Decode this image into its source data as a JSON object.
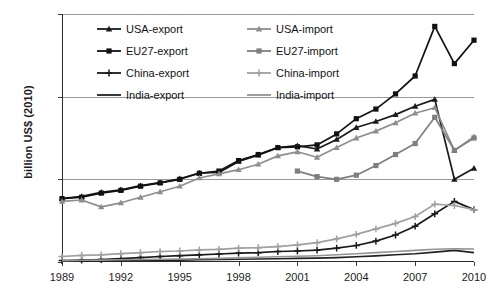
{
  "chart_data": {
    "type": "line",
    "title": "",
    "xlabel": "",
    "ylabel": "billion US$ (2010)",
    "xlim": [
      1989,
      2010
    ],
    "ylim": [
      0,
      90
    ],
    "yticks": [
      0,
      30,
      60,
      90
    ],
    "xticks": [
      1989,
      1992,
      1995,
      1998,
      2001,
      2004,
      2007,
      2010
    ],
    "grid": true,
    "legend_position": "top-inside",
    "x": [
      1989,
      1990,
      1991,
      1992,
      1993,
      1994,
      1995,
      1996,
      1997,
      1998,
      1999,
      2000,
      2001,
      2002,
      2003,
      2004,
      2005,
      2006,
      2007,
      2008,
      2009,
      2010
    ],
    "series": [
      {
        "name": "USA-export",
        "color": "#1a1a1a",
        "marker": "triangle",
        "values": [
          23.0,
          23.8,
          25.3,
          26.2,
          27.7,
          28.8,
          30.2,
          32.3,
          32.5,
          36.5,
          38.8,
          41.5,
          42.2,
          41.0,
          44.5,
          48.8,
          51.0,
          53.5,
          56.5,
          59.0,
          30.0,
          34.0
        ]
      },
      {
        "name": "EU27-export",
        "color": "#111111",
        "marker": "square",
        "values": [
          23.0,
          23.5,
          25.0,
          26.0,
          27.5,
          28.7,
          30.0,
          32.2,
          33.0,
          36.8,
          39.0,
          41.5,
          41.8,
          42.5,
          46.5,
          52.0,
          55.5,
          61.0,
          67.5,
          85.5,
          72.0,
          80.5
        ]
      },
      {
        "name": "China-export",
        "color": "#1a1a1a",
        "marker": "cross",
        "values": [
          0.5,
          0.7,
          0.9,
          1.2,
          1.6,
          2.0,
          2.3,
          2.6,
          2.9,
          3.2,
          3.4,
          3.8,
          4.0,
          4.3,
          5.0,
          6.0,
          7.6,
          9.8,
          13.0,
          17.5,
          22.0,
          19.0
        ]
      },
      {
        "name": "India-export",
        "color": "#222222",
        "marker": "none",
        "values": [
          0.3,
          0.35,
          0.4,
          0.45,
          0.5,
          0.6,
          0.7,
          0.8,
          0.9,
          1.0,
          1.1,
          1.2,
          1.3,
          1.4,
          1.6,
          1.9,
          2.2,
          2.6,
          3.0,
          3.6,
          4.2,
          3.4
        ]
      },
      {
        "name": "USA-import",
        "color": "#8e8e8e",
        "marker": "triangle",
        "values": [
          22.0,
          22.5,
          20.0,
          21.5,
          23.5,
          25.5,
          27.5,
          30.5,
          32.0,
          33.5,
          35.5,
          38.5,
          40.0,
          38.0,
          41.5,
          45.0,
          47.5,
          50.5,
          54.0,
          56.0,
          40.5,
          45.5
        ]
      },
      {
        "name": "EU27-import",
        "color": "#7f7f7f",
        "marker": "square",
        "values": [
          null,
          null,
          null,
          null,
          null,
          null,
          null,
          null,
          null,
          null,
          null,
          null,
          33.0,
          31.0,
          30.0,
          31.5,
          35.0,
          39.0,
          43.0,
          52.5,
          40.5,
          45.0
        ]
      },
      {
        "name": "China-import",
        "color": "#a0a0a0",
        "marker": "cross",
        "values": [
          2.0,
          2.4,
          2.6,
          3.0,
          3.4,
          3.8,
          4.0,
          4.4,
          4.6,
          5.0,
          5.2,
          5.6,
          6.2,
          7.0,
          8.4,
          10.0,
          12.0,
          14.0,
          16.5,
          21.0,
          20.5,
          19.0
        ]
      },
      {
        "name": "India-import",
        "color": "#949494",
        "marker": "none",
        "values": [
          0.5,
          0.6,
          0.7,
          0.8,
          0.9,
          1.0,
          1.1,
          1.2,
          1.3,
          1.5,
          1.7,
          1.9,
          2.1,
          2.3,
          2.6,
          3.0,
          3.4,
          3.8,
          4.2,
          4.6,
          4.8,
          4.7
        ]
      }
    ]
  },
  "axes": {
    "y_title": "billion US$ (2010)",
    "y_tick_labels": [
      "0",
      "30",
      "60",
      "90"
    ],
    "x_tick_labels": [
      "1989",
      "1992",
      "1995",
      "1998",
      "2001",
      "2004",
      "2007",
      "2010"
    ]
  },
  "legend": {
    "entries": [
      {
        "label": "USA-export",
        "series": "USA-export"
      },
      {
        "label": "USA-import",
        "series": "USA-import"
      },
      {
        "label": "EU27-export",
        "series": "EU27-export"
      },
      {
        "label": "EU27-import",
        "series": "EU27-import"
      },
      {
        "label": "China-export",
        "series": "China-export"
      },
      {
        "label": "China-import",
        "series": "China-import"
      },
      {
        "label": "India-export",
        "series": "India-export"
      },
      {
        "label": "India-import",
        "series": "India-import"
      }
    ]
  },
  "colors": {
    "export_dark": "#1a1a1a",
    "import_gray": "#8e8e8e",
    "grid": "#9a9a9a",
    "axis": "#2a2a2a",
    "background": "#ffffff"
  }
}
